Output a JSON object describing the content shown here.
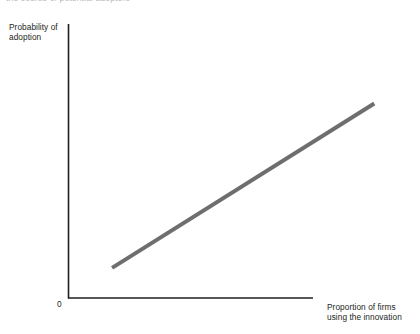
{
  "figure": {
    "clipped_top_caption": "the course of potential adopters",
    "background_color": "#ffffff"
  },
  "chart_data": {
    "type": "line",
    "title": "",
    "subtitle": "",
    "xlabel": "Proportion of firms\nusing the innovation",
    "ylabel": "Probability of\nadoption",
    "origin_label": "0",
    "grid": false,
    "legend": false,
    "legend_position": "none",
    "xlim": [
      0,
      1
    ],
    "ylim": [
      0,
      1
    ],
    "x_tick_labels": [],
    "y_tick_labels": [],
    "axis_color": "#231f20",
    "series": [
      {
        "name": "Probability of adoption",
        "color": "#6e6e6e",
        "line_width_px": 4,
        "x": [
          0.18,
          1.25
        ],
        "y": [
          0.11,
          0.71
        ],
        "points": [
          {
            "x": 0.18,
            "y": 0.11
          },
          {
            "x": 1.25,
            "y": 0.71
          }
        ],
        "description": "Upward sloping straight line"
      }
    ]
  },
  "axes": {
    "y_axis": {
      "x": 68,
      "y_top": 24,
      "y_bottom": 298
    },
    "x_axis": {
      "y": 298,
      "x_left": 68,
      "x_right": 313
    }
  }
}
